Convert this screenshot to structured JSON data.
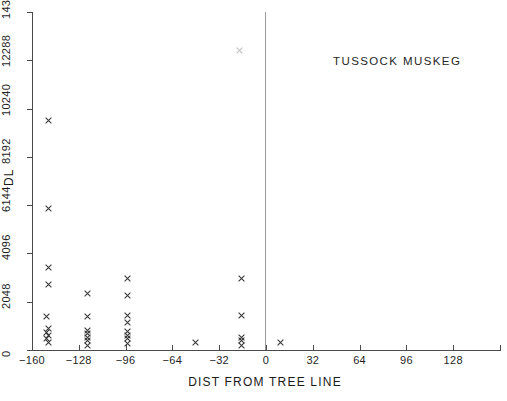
{
  "chart_data": {
    "type": "scatter",
    "title": "TUSSOCK MUSKEG",
    "xlabel": "DIST FROM TREE LINE",
    "ylabel": "DL",
    "xlim": [
      -160,
      160
    ],
    "ylim": [
      0,
      14336
    ],
    "xticks": [
      -160,
      -128,
      -96,
      -64,
      -32,
      0,
      32,
      64,
      96,
      128
    ],
    "xtick_labels": [
      "−160",
      "−128",
      "−96",
      "−64",
      "−32",
      "0",
      "32",
      "64",
      "96",
      "128"
    ],
    "yticks": [
      0,
      2048,
      4096,
      6144,
      8192,
      10240,
      12288,
      14336
    ],
    "ytick_labels": [
      "0",
      "2048",
      "4096",
      "6144",
      "8192",
      "10240",
      "12288",
      "14336"
    ],
    "grid": false,
    "legend": null,
    "marker": "x",
    "marker_color": "#3a3a3a",
    "reference_line_x": 0,
    "points": [
      {
        "x": -149,
        "y": 9730,
        "faint": false
      },
      {
        "x": -149,
        "y": 5990,
        "faint": false
      },
      {
        "x": -149,
        "y": 3520,
        "faint": false
      },
      {
        "x": -149,
        "y": 2790,
        "faint": false
      },
      {
        "x": -150,
        "y": 1420,
        "faint": false
      },
      {
        "x": -149,
        "y": 900,
        "faint": false
      },
      {
        "x": -150,
        "y": 760,
        "faint": false
      },
      {
        "x": -149,
        "y": 620,
        "faint": false
      },
      {
        "x": -150,
        "y": 470,
        "faint": false
      },
      {
        "x": -149,
        "y": 330,
        "faint": false
      },
      {
        "x": -122,
        "y": 2380,
        "faint": false
      },
      {
        "x": -122,
        "y": 1420,
        "faint": false
      },
      {
        "x": -122,
        "y": 830,
        "faint": false
      },
      {
        "x": -122,
        "y": 680,
        "faint": false
      },
      {
        "x": -122,
        "y": 540,
        "faint": false
      },
      {
        "x": -122,
        "y": 390,
        "faint": false
      },
      {
        "x": -122,
        "y": 200,
        "faint": false
      },
      {
        "x": -95,
        "y": 3050,
        "faint": false
      },
      {
        "x": -95,
        "y": 2310,
        "faint": false
      },
      {
        "x": -95,
        "y": 1480,
        "faint": false
      },
      {
        "x": -95,
        "y": 1180,
        "faint": false
      },
      {
        "x": -95,
        "y": 780,
        "faint": false
      },
      {
        "x": -95,
        "y": 620,
        "faint": false
      },
      {
        "x": -95,
        "y": 470,
        "faint": false
      },
      {
        "x": -95,
        "y": 260,
        "faint": false
      },
      {
        "x": -48,
        "y": 330,
        "faint": false
      },
      {
        "x": -18,
        "y": 12700,
        "faint": true
      },
      {
        "x": -17,
        "y": 3050,
        "faint": false
      },
      {
        "x": -17,
        "y": 1470,
        "faint": false
      },
      {
        "x": -17,
        "y": 520,
        "faint": false
      },
      {
        "x": -17,
        "y": 410,
        "faint": false
      },
      {
        "x": -17,
        "y": 180,
        "faint": false
      },
      {
        "x": 10,
        "y": 320,
        "faint": false
      }
    ]
  }
}
